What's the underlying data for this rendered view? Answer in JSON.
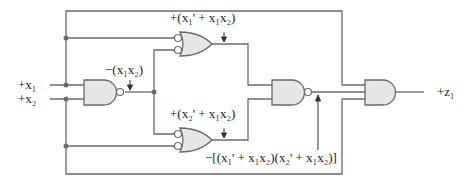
{
  "diagram": {
    "type": "logic-circuit",
    "inputs": [
      {
        "id": "x1",
        "label": "+x₁"
      },
      {
        "id": "x2",
        "label": "+x₂"
      }
    ],
    "output": {
      "id": "z1",
      "label": "+z₁"
    },
    "gates": [
      {
        "id": "nand1",
        "type": "NAND",
        "inputs": [
          "x1",
          "x2"
        ]
      },
      {
        "id": "or_top",
        "type": "OR (active-low inputs)",
        "inputs": [
          "x1",
          "nand1"
        ]
      },
      {
        "id": "or_bottom",
        "type": "OR (active-low inputs)",
        "inputs": [
          "nand1",
          "x2"
        ]
      },
      {
        "id": "nand2",
        "type": "NAND",
        "inputs": [
          "or_top",
          "or_bottom"
        ]
      },
      {
        "id": "and_out",
        "type": "AND",
        "inputs": [
          "x1",
          "nand2",
          "x2"
        ]
      }
    ],
    "annotations": {
      "nand1_out": "−(x₁x₂)",
      "or_top_out": "+(x₁' + x₁x₂)",
      "or_bottom_out": "+(x₂' + x₁x₂)",
      "nand2_out": "−[(x₁' + x₁x₂)(x₂' + x₁x₂)]"
    },
    "colors": {
      "wire": "#6b6b6b",
      "gate_fill": "#e6e6e6",
      "text": "#222222"
    }
  }
}
